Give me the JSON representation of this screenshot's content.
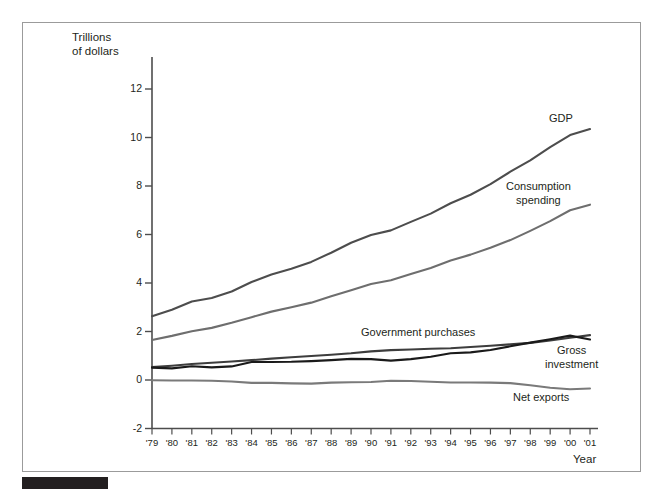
{
  "figure": {
    "background_color": "#ffffff",
    "frame_color": "#9b9b9b",
    "bar_color": "#231f20"
  },
  "chart_data": {
    "type": "line",
    "title": "",
    "xlabel": "Year",
    "ylabel": "Trillions\nof dollars",
    "ylabel_line1": "Trillions",
    "ylabel_line2": "of dollars",
    "xlim": [
      1979,
      2001
    ],
    "ylim": [
      -2,
      13
    ],
    "yticks": [
      -2,
      0,
      2,
      4,
      6,
      8,
      10,
      12
    ],
    "ytick_labels": [
      "-2",
      "0",
      "2",
      "4",
      "6",
      "8",
      "10",
      "12"
    ],
    "grid": false,
    "legend": "inline-labels",
    "x": [
      1979,
      1980,
      1981,
      1982,
      1983,
      1984,
      1985,
      1986,
      1987,
      1988,
      1989,
      1990,
      1991,
      1992,
      1993,
      1994,
      1995,
      1996,
      1997,
      1998,
      1999,
      2000,
      2001
    ],
    "categories": [
      "'79",
      "'80",
      "'81",
      "'82",
      "'83",
      "'84",
      "'85",
      "'86",
      "'87",
      "'88",
      "'89",
      "'90",
      "'91",
      "'92",
      "'93",
      "'94",
      "'95",
      "'96",
      "'97",
      "'98",
      "'99",
      "'00",
      "'01"
    ],
    "series": [
      {
        "name": "GDP",
        "color": "#4d4d4d",
        "values": [
          2.63,
          2.9,
          3.24,
          3.38,
          3.65,
          4.04,
          4.35,
          4.59,
          4.87,
          5.25,
          5.66,
          5.98,
          6.17,
          6.52,
          6.86,
          7.29,
          7.64,
          8.08,
          8.59,
          9.06,
          9.6,
          10.1,
          10.35
        ]
      },
      {
        "name": "Consumption\nspending",
        "label_line1": "Consumption",
        "label_line2": "spending",
        "color": "#6e6e6e",
        "values": [
          1.65,
          1.82,
          2.01,
          2.15,
          2.36,
          2.59,
          2.82,
          3.0,
          3.19,
          3.45,
          3.7,
          3.96,
          4.11,
          4.37,
          4.62,
          4.93,
          5.17,
          5.45,
          5.77,
          6.15,
          6.55,
          7.0,
          7.23
        ]
      },
      {
        "name": "Government purchases",
        "color": "#3d3d3d",
        "values": [
          0.53,
          0.59,
          0.66,
          0.71,
          0.76,
          0.82,
          0.88,
          0.94,
          0.99,
          1.04,
          1.1,
          1.18,
          1.23,
          1.26,
          1.29,
          1.31,
          1.36,
          1.41,
          1.47,
          1.53,
          1.63,
          1.74,
          1.85
        ]
      },
      {
        "name": "Gross\ninvestment",
        "label_line1": "Gross",
        "label_line2": "investment",
        "color": "#1a1a1a",
        "values": [
          0.51,
          0.48,
          0.57,
          0.52,
          0.56,
          0.74,
          0.74,
          0.75,
          0.78,
          0.82,
          0.87,
          0.86,
          0.8,
          0.86,
          0.96,
          1.1,
          1.14,
          1.24,
          1.39,
          1.54,
          1.68,
          1.83,
          1.67
        ]
      },
      {
        "name": "Net exports",
        "color": "#7a7a7a",
        "values": [
          -0.01,
          -0.02,
          -0.02,
          -0.03,
          -0.06,
          -0.12,
          -0.12,
          -0.14,
          -0.15,
          -0.11,
          -0.09,
          -0.08,
          -0.03,
          -0.04,
          -0.07,
          -0.1,
          -0.1,
          -0.11,
          -0.13,
          -0.22,
          -0.32,
          -0.38,
          -0.35
        ]
      }
    ]
  }
}
